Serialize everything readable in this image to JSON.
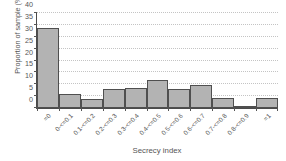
{
  "chart_data": {
    "type": "bar",
    "title": "",
    "xlabel": "Secrecy index",
    "ylabel": "Proportion of sample (%)",
    "categories": [
      "=0",
      "0-<=0.1",
      "0.1-<=0.2",
      "0.2-<=0.3",
      "0.3-<=0.4",
      "0.4-<=0.5",
      "0.5-<=0.6",
      "0.6-<=0.7",
      "0.7-<=0.8",
      "0.8-<=0.9",
      "=1"
    ],
    "values": [
      33.5,
      6.0,
      4.0,
      7.8,
      8.3,
      11.7,
      7.8,
      9.7,
      4.4,
      1.0,
      4.4
    ],
    "ylim": [
      0,
      40
    ],
    "yticks": [
      0,
      5,
      10,
      15,
      20,
      25,
      30,
      35,
      40
    ],
    "ytick_labels": [
      "0",
      "5",
      "10",
      "15",
      "20",
      "25",
      "30",
      "35",
      "40"
    ],
    "grid": "horizontal-dotted",
    "legend": "none",
    "bar_fill_color": "#b3b3b3",
    "bar_edge_color": "#4f4f4f",
    "axis_color": "#4a4a4a",
    "grid_color": "#c4c4c4",
    "text_color": "#555555",
    "background_color": "#ffffff"
  }
}
